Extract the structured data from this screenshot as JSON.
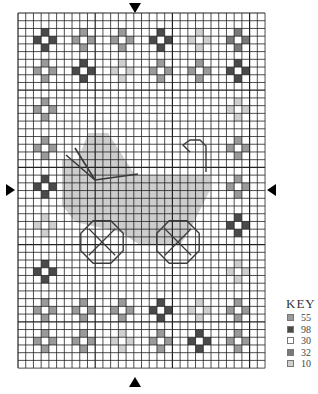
{
  "chart_data": {
    "type": "cross-stitch-pattern",
    "grid": {
      "cols": 32,
      "rows": 46,
      "origin_x": 18,
      "origin_y": 13,
      "cell": 7.72
    },
    "colors": {
      "55": "#9a9a9a",
      "98": "#4a4a4a",
      "30": "#ffffff",
      "32": "#7a7a7a",
      "10": "#cfcfcf",
      "fill": "#cdcdcd",
      "line": "#3a3a3a"
    },
    "motifs": [
      {
        "col": 3,
        "row": 3,
        "color": "98"
      },
      {
        "col": 8,
        "row": 3,
        "color": "55"
      },
      {
        "col": 13,
        "row": 3,
        "color": "55"
      },
      {
        "col": 18,
        "row": 3,
        "color": "98"
      },
      {
        "col": 23,
        "row": 3,
        "color": "10"
      },
      {
        "col": 28,
        "row": 3,
        "color": "32"
      },
      {
        "col": 3,
        "row": 7,
        "color": "55"
      },
      {
        "col": 8,
        "row": 7,
        "color": "98"
      },
      {
        "col": 13,
        "row": 7,
        "color": "10"
      },
      {
        "col": 18,
        "row": 7,
        "color": "55"
      },
      {
        "col": 23,
        "row": 7,
        "color": "55"
      },
      {
        "col": 28,
        "row": 7,
        "color": "98"
      },
      {
        "col": 3,
        "row": 12,
        "color": "55"
      },
      {
        "col": 28,
        "row": 12,
        "color": "10"
      },
      {
        "col": 3,
        "row": 17,
        "color": "55"
      },
      {
        "col": 28,
        "row": 17,
        "color": "55"
      },
      {
        "col": 3,
        "row": 22,
        "color": "98"
      },
      {
        "col": 28,
        "row": 22,
        "color": "55"
      },
      {
        "col": 3,
        "row": 27,
        "color": "10"
      },
      {
        "col": 28,
        "row": 27,
        "color": "98"
      },
      {
        "col": 3,
        "row": 33,
        "color": "98"
      },
      {
        "col": 28,
        "row": 33,
        "color": "10"
      },
      {
        "col": 3,
        "row": 38,
        "color": "55"
      },
      {
        "col": 8,
        "row": 38,
        "color": "55"
      },
      {
        "col": 13,
        "row": 38,
        "color": "55"
      },
      {
        "col": 18,
        "row": 38,
        "color": "98"
      },
      {
        "col": 23,
        "row": 38,
        "color": "10"
      },
      {
        "col": 28,
        "row": 38,
        "color": "55"
      },
      {
        "col": 3,
        "row": 42,
        "color": "55"
      },
      {
        "col": 8,
        "row": 42,
        "color": "55"
      },
      {
        "col": 13,
        "row": 42,
        "color": "10"
      },
      {
        "col": 18,
        "row": 42,
        "color": "55"
      },
      {
        "col": 23,
        "row": 42,
        "color": "98"
      },
      {
        "col": 28,
        "row": 42,
        "color": "55"
      }
    ],
    "carriage": {
      "body_polygon": [
        [
          62,
          160
        ],
        [
          78,
          160
        ],
        [
          88,
          133
        ],
        [
          108,
          133
        ],
        [
          135,
          175
        ],
        [
          210,
          175
        ],
        [
          210,
          190
        ],
        [
          190,
          230
        ],
        [
          180,
          245
        ],
        [
          140,
          245
        ],
        [
          120,
          232
        ],
        [
          75,
          222
        ],
        [
          62,
          205
        ]
      ],
      "hood_lines": [
        [
          [
            66,
            155
          ],
          [
            95,
            180
          ]
        ],
        [
          [
            75,
            148
          ],
          [
            95,
            180
          ]
        ],
        [
          [
            95,
            180
          ],
          [
            138,
            174
          ]
        ]
      ],
      "handle": [
        [
          190,
          152
        ],
        [
          183,
          145
        ],
        [
          190,
          140
        ],
        [
          200,
          140
        ],
        [
          206,
          146
        ],
        [
          206,
          172
        ]
      ],
      "wheels": [
        {
          "cx": 102,
          "cy": 242,
          "r": 23
        },
        {
          "cx": 178,
          "cy": 242,
          "r": 23
        }
      ]
    },
    "center_arrows": {
      "top": [
        135,
        5
      ],
      "bottom": [
        135,
        382
      ],
      "left": [
        6,
        190
      ],
      "right": [
        276,
        190
      ]
    },
    "key": {
      "title": "KEY",
      "items": [
        {
          "code": "55",
          "color": "#9a9a9a"
        },
        {
          "code": "98",
          "color": "#4a4a4a"
        },
        {
          "code": "30",
          "color": "#ffffff"
        },
        {
          "code": "32",
          "color": "#7a7a7a"
        },
        {
          "code": "10",
          "color": "#cfcfcf"
        }
      ]
    }
  }
}
